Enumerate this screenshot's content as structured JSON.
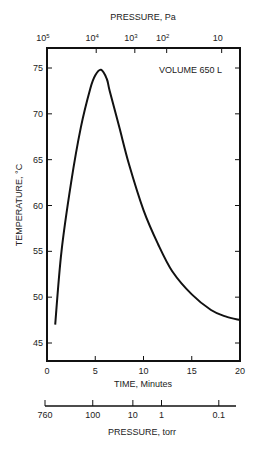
{
  "chart_data": {
    "type": "line",
    "title": "",
    "annotation": "VOLUME 650 L",
    "xlabel": "TIME, Minutes",
    "ylabel": "TEMPERATURE, °C",
    "xlim": [
      0,
      20
    ],
    "ylim": [
      43,
      77
    ],
    "x_ticks": [
      0,
      5,
      10,
      15,
      20
    ],
    "x_tick_labels": [
      "0",
      "5",
      "10",
      "15",
      "20"
    ],
    "y_ticks": [
      45,
      50,
      55,
      60,
      65,
      70,
      75
    ],
    "y_tick_labels": [
      "45",
      "50",
      "55",
      "60",
      "65",
      "70",
      "75"
    ],
    "top_axis": {
      "label": "PRESSURE, Pa",
      "ticks": [
        {
          "base": "10",
          "exp": "5",
          "x_minutes": 0.0
        },
        {
          "base": "10",
          "exp": "4",
          "x_minutes": 5.1
        },
        {
          "base": "10",
          "exp": "3",
          "x_minutes": 9.1
        },
        {
          "base": "10",
          "exp": "2",
          "x_minutes": 12.4
        },
        {
          "base": "10",
          "exp": "",
          "x_minutes": 18.1
        }
      ]
    },
    "bottom_pressure_axis": {
      "label": "PRESSURE, torr",
      "ticks": [
        {
          "label": "760",
          "pos": 0.0
        },
        {
          "label": "100",
          "pos": 0.25
        },
        {
          "label": "10",
          "pos": 0.46
        },
        {
          "label": "1",
          "pos": 0.61
        },
        {
          "label": "0.1",
          "pos": 0.91
        }
      ]
    },
    "grid": false,
    "legend": null,
    "series": [
      {
        "name": "Temperature",
        "x": [
          0.85,
          1.5,
          2.5,
          3.5,
          4.5,
          5.0,
          5.6,
          6.2,
          6.5,
          7.5,
          8.5,
          10,
          11.5,
          13,
          15,
          17,
          18.5,
          20
        ],
        "values": [
          47.0,
          55.0,
          62.5,
          68.5,
          72.8,
          74.2,
          74.8,
          73.8,
          72.5,
          68.5,
          64.5,
          59.5,
          55.8,
          52.8,
          50.3,
          48.6,
          47.9,
          47.5
        ]
      }
    ]
  }
}
